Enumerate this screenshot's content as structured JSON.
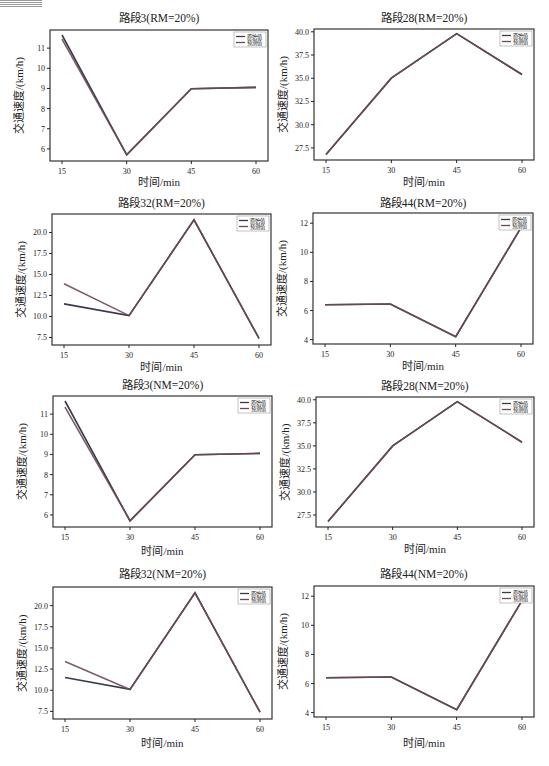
{
  "legend": {
    "original": "原始值",
    "predicted": "预测值"
  },
  "colors": {
    "original": "#3a3a4a",
    "predicted": "#6a4a5a",
    "axis": "#222222"
  },
  "chart_data": [
    {
      "type": "line",
      "title": "路段3(RM=20%)",
      "xlabel": "时间/min",
      "ylabel": "交通速度/(km/h)",
      "x": [
        15,
        30,
        45,
        60
      ],
      "ylim": [
        5.4,
        11.9
      ],
      "yticks": [
        6,
        7,
        8,
        9,
        10,
        11
      ],
      "ytick_labels": [
        "6",
        "7",
        "8",
        "9",
        "10",
        "11"
      ],
      "series": [
        {
          "name": "原始值",
          "values": [
            11.65,
            5.7,
            8.98,
            9.05
          ]
        },
        {
          "name": "预测值",
          "values": [
            11.45,
            5.72,
            8.98,
            9.05
          ]
        }
      ],
      "legend_position": "upper right",
      "grid": false
    },
    {
      "type": "line",
      "title": "路段28(RM=20%)",
      "xlabel": "时间/min",
      "ylabel": "交通速度/(km/h)",
      "x": [
        15,
        30,
        45,
        60
      ],
      "ylim": [
        26.2,
        40.3
      ],
      "yticks": [
        27.5,
        30.0,
        32.5,
        35.0,
        37.5,
        40.0
      ],
      "ytick_labels": [
        "27.5",
        "30.0",
        "32.5",
        "35.0",
        "37.5",
        "40.0"
      ],
      "series": [
        {
          "name": "原始值",
          "values": [
            26.8,
            35.0,
            39.8,
            35.4
          ]
        },
        {
          "name": "预测值",
          "values": [
            26.8,
            35.0,
            39.8,
            35.4
          ]
        }
      ],
      "legend_position": "upper right",
      "grid": false
    },
    {
      "type": "line",
      "title": "路段32(RM=20%)",
      "xlabel": "时间/min",
      "ylabel": "交通速度/(km/h)",
      "x": [
        15,
        30,
        45,
        60
      ],
      "ylim": [
        6.6,
        22.2
      ],
      "yticks": [
        7.5,
        10.0,
        12.5,
        15.0,
        17.5,
        20.0
      ],
      "ytick_labels": [
        "7.5",
        "10.0",
        "12.5",
        "15.0",
        "17.5",
        "20.0"
      ],
      "series": [
        {
          "name": "原始值",
          "values": [
            11.5,
            10.1,
            21.5,
            7.4
          ]
        },
        {
          "name": "预测值",
          "values": [
            13.9,
            10.1,
            21.5,
            7.4
          ]
        }
      ],
      "legend_position": "upper right",
      "grid": false
    },
    {
      "type": "line",
      "title": "路段44(RM=20%)",
      "xlabel": "时间/min",
      "ylabel": "交通速度/(km/h)",
      "x": [
        15,
        30,
        45,
        60
      ],
      "ylim": [
        3.7,
        12.7
      ],
      "yticks": [
        4,
        6,
        8,
        10,
        12
      ],
      "ytick_labels": [
        "4",
        "6",
        "8",
        "10",
        "12"
      ],
      "series": [
        {
          "name": "原始值",
          "values": [
            6.4,
            6.45,
            4.2,
            11.7
          ]
        },
        {
          "name": "预测值",
          "values": [
            6.4,
            6.45,
            4.2,
            11.7
          ]
        }
      ],
      "legend_position": "upper right",
      "grid": false
    },
    {
      "type": "line",
      "title": "路段3(NM=20%)",
      "xlabel": "时间/min",
      "ylabel": "交通速度/(km/h)",
      "x": [
        15,
        30,
        45,
        60
      ],
      "ylim": [
        5.4,
        11.9
      ],
      "yticks": [
        6,
        7,
        8,
        9,
        10,
        11
      ],
      "ytick_labels": [
        "6",
        "7",
        "8",
        "9",
        "10",
        "11"
      ],
      "series": [
        {
          "name": "原始值",
          "values": [
            11.65,
            5.7,
            8.98,
            9.05
          ]
        },
        {
          "name": "预测值",
          "values": [
            11.35,
            5.72,
            8.98,
            9.05
          ]
        }
      ],
      "legend_position": "upper right",
      "grid": false
    },
    {
      "type": "line",
      "title": "路段28(NM=20%)",
      "xlabel": "时间/min",
      "ylabel": "交通速度/(km/h)",
      "x": [
        15,
        30,
        45,
        60
      ],
      "ylim": [
        26.2,
        40.3
      ],
      "yticks": [
        27.5,
        30.0,
        32.5,
        35.0,
        37.5,
        40.0
      ],
      "ytick_labels": [
        "27.5",
        "30.0",
        "32.5",
        "35.0",
        "37.5",
        "40.0"
      ],
      "series": [
        {
          "name": "原始值",
          "values": [
            26.8,
            35.0,
            39.8,
            35.4
          ]
        },
        {
          "name": "预测值",
          "values": [
            26.8,
            35.0,
            39.8,
            35.4
          ]
        }
      ],
      "legend_position": "upper right",
      "grid": false
    },
    {
      "type": "line",
      "title": "路段32(NM=20%)",
      "xlabel": "时间/min",
      "ylabel": "交通速度/(km/h)",
      "x": [
        15,
        30,
        45,
        60
      ],
      "ylim": [
        6.6,
        22.2
      ],
      "yticks": [
        7.5,
        10.0,
        12.5,
        15.0,
        17.5,
        20.0
      ],
      "ytick_labels": [
        "7.5",
        "10.0",
        "12.5",
        "15.0",
        "17.5",
        "20.0"
      ],
      "series": [
        {
          "name": "原始值",
          "values": [
            11.5,
            10.1,
            21.5,
            7.4
          ]
        },
        {
          "name": "预测值",
          "values": [
            13.4,
            10.1,
            21.5,
            7.4
          ]
        }
      ],
      "legend_position": "upper right",
      "grid": false
    },
    {
      "type": "line",
      "title": "路段44(NM=20%)",
      "xlabel": "时间/min",
      "ylabel": "交通速度/(km/h)",
      "x": [
        15,
        30,
        45,
        60
      ],
      "ylim": [
        3.7,
        12.7
      ],
      "yticks": [
        4,
        6,
        8,
        10,
        12
      ],
      "ytick_labels": [
        "4",
        "6",
        "8",
        "10",
        "12"
      ],
      "series": [
        {
          "name": "原始值",
          "values": [
            6.4,
            6.45,
            4.2,
            11.7
          ]
        },
        {
          "name": "预测值",
          "values": [
            6.4,
            6.45,
            4.2,
            11.7
          ]
        }
      ],
      "legend_position": "upper right",
      "grid": false
    }
  ]
}
